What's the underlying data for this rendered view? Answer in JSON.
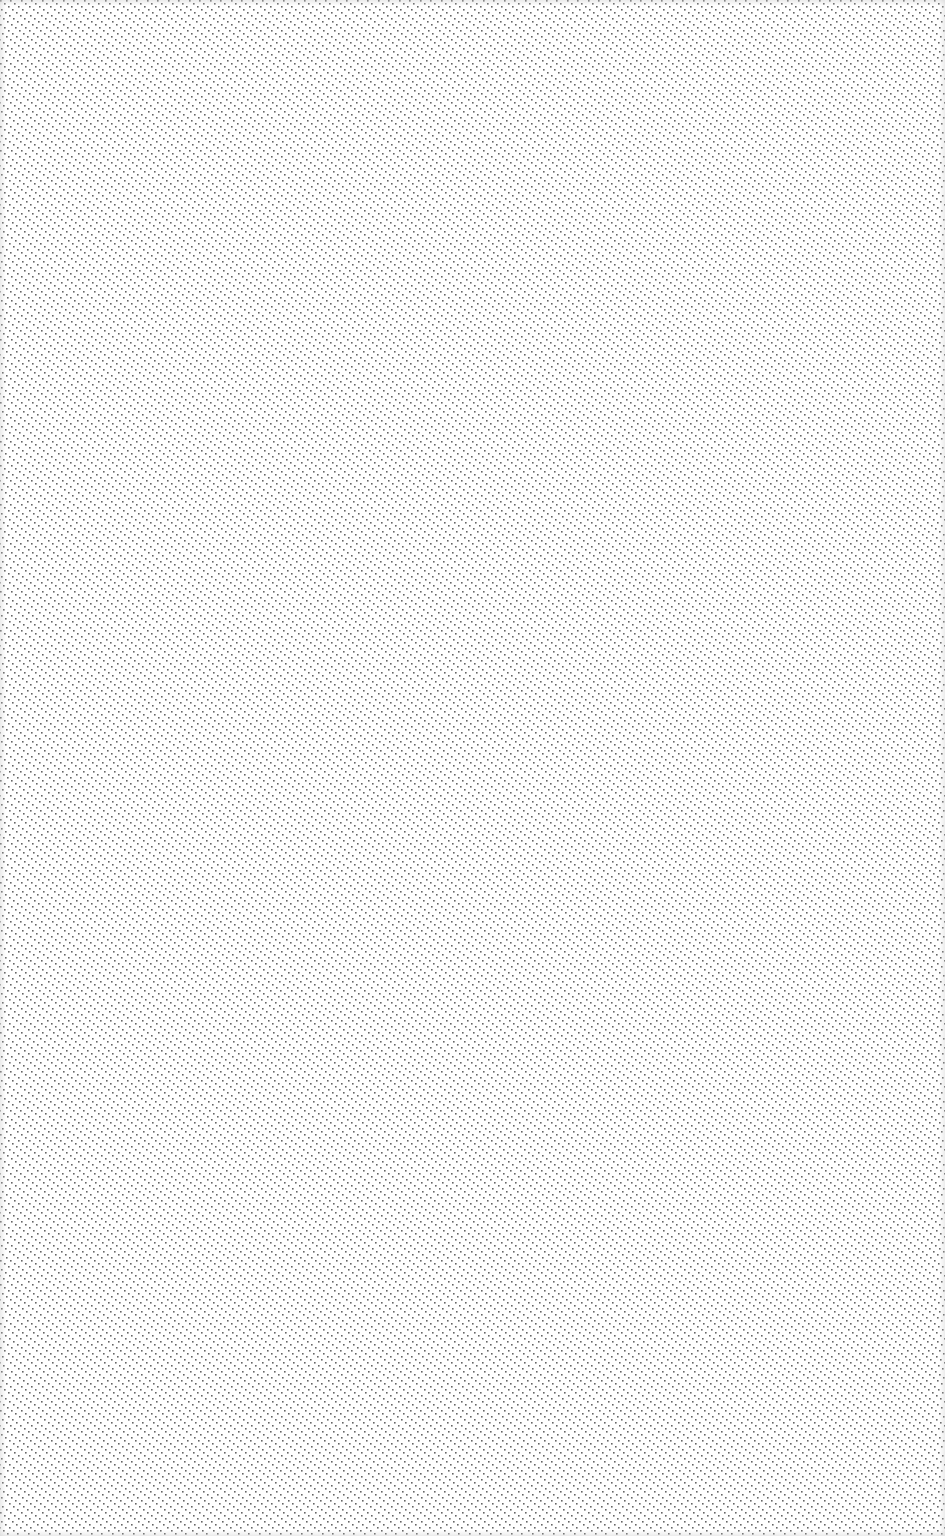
{
  "canvas": {
    "width": 945,
    "height": 1536,
    "background_color": "#ffffff"
  },
  "pattern": {
    "type": "diagonal-dotted-lines",
    "direction": "top-left-to-bottom-right",
    "dot_color": "#4a4a4a",
    "dot_size": 1.6,
    "dot_step_x": 4,
    "dot_step_y": 3,
    "line_spacing_x": 10.5
  }
}
